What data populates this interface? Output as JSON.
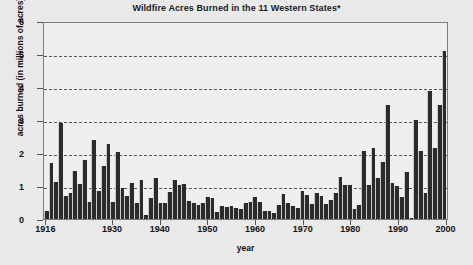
{
  "chart_data": {
    "type": "bar",
    "title": "Wildfire Acres Burned in the 11 Western States*",
    "xlabel": "year",
    "ylabel": "acres burned (in millions of acres)",
    "ylim": [
      0,
      6
    ],
    "ytick_labels": [
      "0",
      "1",
      "2",
      "3",
      "4",
      "5",
      "6"
    ],
    "ytick_values": [
      0,
      1,
      2,
      3,
      4,
      5,
      6
    ],
    "gridlines": [
      1,
      2,
      3,
      4,
      5
    ],
    "grid": "horizontal-dashed",
    "legend": "none",
    "xtick_labels": [
      "1916",
      "1930",
      "1940",
      "1950",
      "1960",
      "1970",
      "1980",
      "1990",
      "2000"
    ],
    "xtick_values": [
      1916,
      1930,
      1940,
      1950,
      1960,
      1970,
      1980,
      1990,
      2000
    ],
    "xlim": [
      1916,
      2000
    ],
    "bar_color": "#2b2b2b",
    "plot_background": "#efefef",
    "figure_background": "#e9e9e9",
    "categories": [
      1916,
      1917,
      1918,
      1919,
      1920,
      1921,
      1922,
      1923,
      1924,
      1925,
      1926,
      1927,
      1928,
      1929,
      1930,
      1931,
      1932,
      1933,
      1934,
      1935,
      1936,
      1937,
      1938,
      1939,
      1940,
      1941,
      1942,
      1943,
      1944,
      1945,
      1946,
      1947,
      1948,
      1949,
      1950,
      1951,
      1952,
      1953,
      1954,
      1955,
      1956,
      1957,
      1958,
      1959,
      1960,
      1961,
      1962,
      1963,
      1964,
      1965,
      1966,
      1967,
      1968,
      1969,
      1970,
      1971,
      1972,
      1973,
      1974,
      1975,
      1976,
      1977,
      1978,
      1979,
      1980,
      1981,
      1982,
      1983,
      1984,
      1985,
      1986,
      1987,
      1988,
      1989,
      1990,
      1991,
      1992,
      1993,
      1994,
      1995,
      1996,
      1997,
      1998,
      1999,
      2000
    ],
    "values": [
      0.25,
      1.71,
      1.12,
      2.92,
      0.7,
      0.78,
      1.47,
      1.07,
      1.79,
      0.52,
      2.4,
      0.86,
      1.61,
      2.28,
      0.51,
      2.02,
      0.93,
      0.71,
      1.08,
      0.48,
      1.19,
      0.11,
      0.64,
      1.23,
      0.48,
      0.5,
      0.81,
      1.19,
      1.04,
      1.07,
      0.55,
      0.5,
      0.43,
      0.48,
      0.67,
      0.64,
      0.21,
      0.39,
      0.35,
      0.4,
      0.32,
      0.29,
      0.49,
      0.52,
      0.66,
      0.53,
      0.24,
      0.23,
      0.18,
      0.41,
      0.75,
      0.49,
      0.38,
      0.33,
      0.84,
      0.74,
      0.45,
      0.8,
      0.71,
      0.47,
      0.59,
      0.8,
      1.28,
      1.02,
      1.04,
      0.3,
      0.43,
      2.05,
      1.04,
      2.16,
      1.24,
      1.72,
      3.47,
      1.08,
      1.0,
      0.66,
      1.42,
      0.04,
      3.0,
      2.06,
      0.78,
      3.89,
      2.14,
      3.45,
      5.08
    ]
  }
}
